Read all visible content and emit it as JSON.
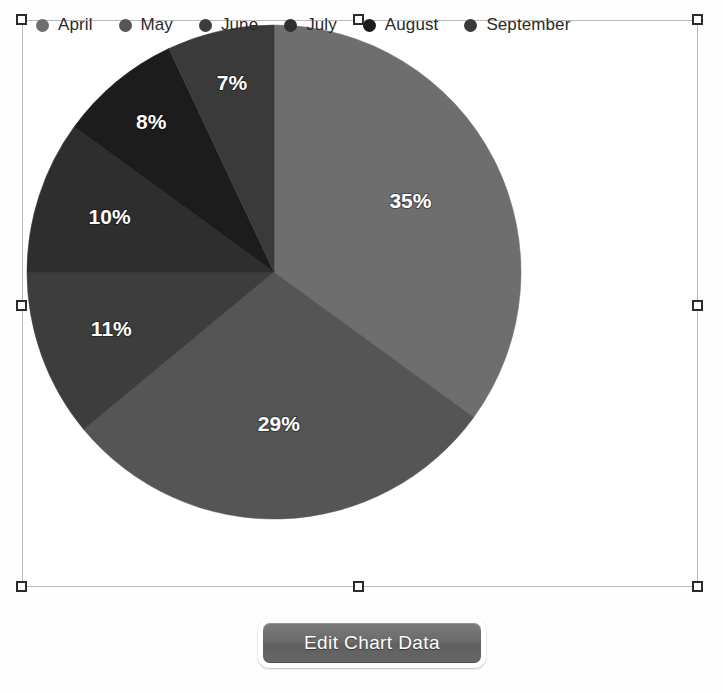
{
  "legend": {
    "position": "top",
    "items": [
      {
        "label": "April",
        "color": "#6e6e6e"
      },
      {
        "label": "May",
        "color": "#555555"
      },
      {
        "label": "June",
        "color": "#3d3d3d"
      },
      {
        "label": "July",
        "color": "#2e2e2e"
      },
      {
        "label": "August",
        "color": "#1c1c1c"
      },
      {
        "label": "September",
        "color": "#3a3a3a"
      }
    ]
  },
  "chart_data": {
    "type": "pie",
    "title": "",
    "subtitle": "",
    "xlabel": "",
    "ylabel": "",
    "grid": false,
    "legend_position": "top",
    "start_angle_deg": 0,
    "direction": "clockwise",
    "categories": [
      "April",
      "May",
      "June",
      "July",
      "August",
      "September"
    ],
    "values": [
      35,
      29,
      11,
      10,
      8,
      7
    ],
    "value_unit": "%",
    "slices": [
      {
        "label": "April",
        "value": 35,
        "data_label": "35%",
        "color": "#6e6e6e"
      },
      {
        "label": "May",
        "value": 29,
        "data_label": "29%",
        "color": "#555555"
      },
      {
        "label": "June",
        "value": 11,
        "data_label": "11%",
        "color": "#3d3d3d"
      },
      {
        "label": "July",
        "value": 10,
        "data_label": "10%",
        "color": "#2e2e2e"
      },
      {
        "label": "August",
        "value": 8,
        "data_label": "8%",
        "color": "#1c1c1c"
      },
      {
        "label": "September",
        "value": 7,
        "data_label": "7%",
        "color": "#3a3a3a"
      }
    ]
  },
  "toolbar": {
    "edit_chart_data_label": "Edit Chart Data"
  },
  "selection": {
    "handle_count": 8,
    "handle_fill": "#ffffff",
    "handle_border": "#2b2b2b",
    "frame_color": "#b9b9b9"
  },
  "canvas": {
    "background": "#ffffff"
  }
}
